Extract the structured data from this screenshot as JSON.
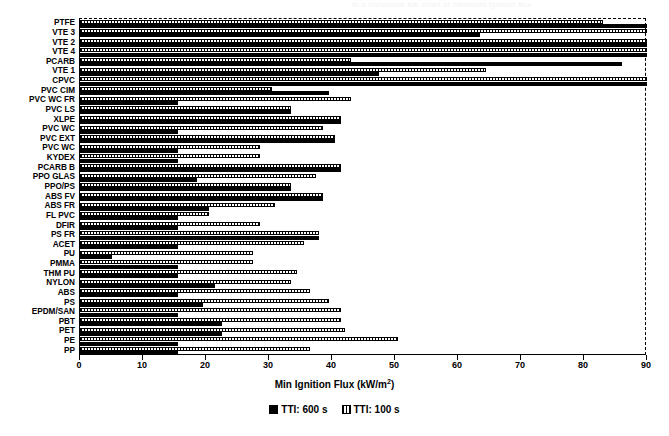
{
  "figure": {
    "top_fragment": "in a horizontal bar chart of minimum ignition flux",
    "axis_title_main": "Min Ignition Flux (kW/m",
    "axis_title_sup": "2",
    "axis_title_close": ")"
  },
  "legend": {
    "position": "bottom-center",
    "entries": [
      {
        "label": "TTI: 600 s",
        "swatch": "black"
      },
      {
        "label": "TTI: 100 s",
        "swatch": "hatch"
      }
    ]
  },
  "chart_data": {
    "type": "bar",
    "orientation": "horizontal",
    "title": "",
    "xlabel": "Min Ignition Flux (kW/m2)",
    "ylabel": "",
    "xlim": [
      0,
      90
    ],
    "xticks": [
      0,
      10,
      20,
      30,
      40,
      50,
      60,
      70,
      80,
      90
    ],
    "xticklabels": [
      "0",
      "10",
      "20",
      "30",
      "40",
      "50",
      "60",
      "70",
      "80",
      "90"
    ],
    "grid": false,
    "categories": [
      "PTFE",
      "VTE 3",
      "VTE 2",
      "VTE 4",
      "PCARB",
      "VTE 1",
      "CPVC",
      "PVC CIM",
      "PVC WC FR",
      "PVC LS",
      "XLPE",
      "PVC WC",
      "PVC EXT",
      "PVC WC",
      "KYDEX",
      "PCARB B",
      "PPO GLAS",
      "PPO/PS",
      "ABS FV",
      "ABS FR",
      "FL PVC",
      "DFIR",
      "PS FR",
      "ACET",
      "PU",
      "PMMA",
      "THM PU",
      "NYLON",
      "ABS",
      "PS",
      "EPDM/SAN",
      "PBT",
      "PET",
      "PE",
      "PP"
    ],
    "series": [
      {
        "name": "TTI: 600 s",
        "swatch": "black",
        "values": [
          90,
          63.5,
          90,
          90,
          86,
          47.5,
          90,
          39.5,
          15.5,
          33.5,
          41.5,
          15.5,
          40.5,
          15.5,
          15.5,
          41.5,
          18.5,
          33.5,
          38.5,
          20.5,
          15.5,
          15.5,
          38,
          15.5,
          5.0,
          15.5,
          15.5,
          21.5,
          15.5,
          19.5,
          15.5,
          22.5,
          22.5,
          15.5,
          15.5
        ]
      },
      {
        "name": "TTI: 100 s",
        "swatch": "hatch",
        "values": [
          83,
          90,
          90,
          90,
          43,
          64.5,
          90,
          30.5,
          43,
          33.5,
          41.5,
          38.5,
          40.5,
          28.5,
          28.5,
          41.5,
          37.5,
          33.5,
          38.5,
          31,
          20.5,
          28.5,
          38,
          35.5,
          27.5,
          27.5,
          34.5,
          33.5,
          36.5,
          39.5,
          41.5,
          41.5,
          42,
          50.5,
          36.5
        ]
      }
    ]
  }
}
